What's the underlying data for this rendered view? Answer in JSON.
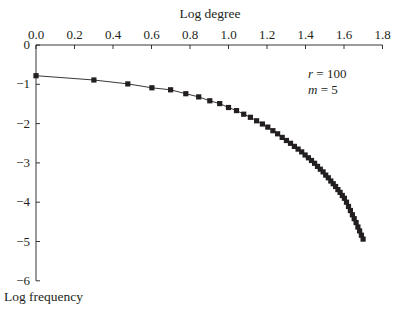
{
  "chart_data": {
    "type": "scatter",
    "title": "",
    "xlabel": "Log degree",
    "ylabel": "Log frequency",
    "xlim": [
      0.0,
      1.8
    ],
    "ylim": [
      -6,
      0
    ],
    "x_ticks": [
      "0.0",
      "0.2",
      "0.4",
      "0.6",
      "0.8",
      "1.0",
      "1.2",
      "1.4",
      "1.6",
      "1.8"
    ],
    "y_ticks": [
      "0",
      "−1",
      "−2",
      "−3",
      "−4",
      "−5",
      "−6"
    ],
    "x_axis_position": "top",
    "grid": false,
    "legend": null,
    "annotations": [
      {
        "var": "r",
        "text": " = 100"
      },
      {
        "var": "m",
        "text": " = 5"
      }
    ],
    "series": [
      {
        "name": "degree distribution",
        "marker": "square",
        "line": "smooth fit",
        "color": "#231f20",
        "degree": [
          1,
          2,
          3,
          4,
          5,
          6,
          7,
          8,
          9,
          10,
          11,
          12,
          13,
          14,
          15,
          16,
          17,
          18,
          19,
          20,
          21,
          22,
          23,
          24,
          25,
          26,
          27,
          28,
          29,
          30,
          31,
          32,
          33,
          34,
          35,
          36,
          37,
          38,
          39,
          40,
          41,
          42,
          43,
          44,
          45,
          46,
          47,
          48,
          49,
          50
        ],
        "y": [
          -0.78,
          -0.89,
          -0.99,
          -1.09,
          -1.14,
          -1.24,
          -1.32,
          -1.42,
          -1.49,
          -1.59,
          -1.67,
          -1.76,
          -1.84,
          -1.93,
          -2.01,
          -2.09,
          -2.18,
          -2.26,
          -2.35,
          -2.43,
          -2.5,
          -2.58,
          -2.65,
          -2.72,
          -2.8,
          -2.87,
          -2.94,
          -3.01,
          -3.09,
          -3.16,
          -3.23,
          -3.31,
          -3.38,
          -3.46,
          -3.53,
          -3.6,
          -3.68,
          -3.75,
          -3.83,
          -3.9,
          -4.0,
          -4.11,
          -4.21,
          -4.32,
          -4.42,
          -4.52,
          -4.63,
          -4.73,
          -4.84,
          -4.94
        ]
      }
    ]
  }
}
